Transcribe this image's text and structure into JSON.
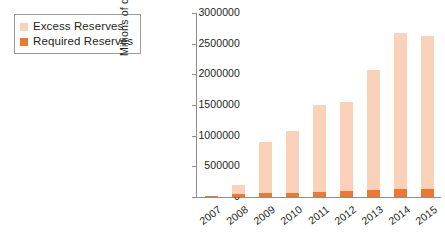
{
  "legend": {
    "position": "top-left",
    "items": [
      {
        "label": "Excess Reserves",
        "color": "#f9d2b9",
        "icon": "square-swatch"
      },
      {
        "label": "Required Reserves",
        "color": "#f0772f",
        "icon": "square-swatch"
      }
    ]
  },
  "axes": {
    "ylabel": "Millions of dollars",
    "xlabel": "",
    "yticks": [
      "0",
      "500000",
      "1000000",
      "1500000",
      "2000000",
      "2500000",
      "3000000"
    ]
  },
  "chart_data": {
    "type": "bar",
    "subtype": "stacked-vertical",
    "title": "",
    "subtitle": "",
    "xlabel": "",
    "ylabel": "Millions of dollars",
    "categories": [
      "2007",
      "2008",
      "2009",
      "2010",
      "2011",
      "2012",
      "2013",
      "2014",
      "2015"
    ],
    "series": [
      {
        "name": "Required Reserves",
        "color": "#f0772f",
        "values": [
          22000,
          45000,
          62000,
          72000,
          85000,
          96000,
          110000,
          125000,
          135000
        ]
      },
      {
        "name": "Excess Reserves",
        "color": "#f9d2b9",
        "values": [
          2000,
          155000,
          835000,
          1010000,
          1415000,
          1455000,
          1965000,
          2545000,
          2490000
        ]
      }
    ],
    "totals": [
      24000,
      200000,
      897000,
      1082000,
      1500000,
      1551000,
      2075000,
      2670000,
      2625000
    ],
    "ylim": [
      0,
      3000000
    ],
    "ytick_interval": 500000,
    "grid": false,
    "legend_position": "top-left"
  }
}
